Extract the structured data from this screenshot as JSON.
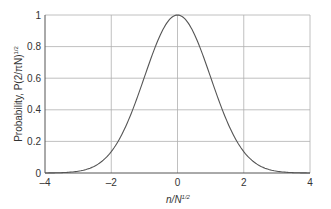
{
  "chart_data": {
    "type": "line",
    "title": "",
    "xlabel": "n/N^1/2",
    "xlabel_parts": {
      "base": "n/N",
      "sup": "1/2"
    },
    "ylabel": "Probability, P(2/πN)^1/2",
    "ylabel_parts": {
      "base": "Probability, P(2/πN)",
      "sup": "1/2"
    },
    "xlim": [
      -4,
      4
    ],
    "ylim": [
      0,
      1
    ],
    "xticks": [
      -4,
      -2,
      0,
      2,
      4
    ],
    "xtick_labels": [
      "–4",
      "–2",
      "0",
      "2",
      "4"
    ],
    "yticks": [
      0,
      0.2,
      0.4,
      0.6,
      0.8,
      1
    ],
    "ytick_labels": [
      "0",
      "0.2",
      "0.4",
      "0.6",
      "0.8",
      "1"
    ],
    "grid": true,
    "legend": null,
    "series": [
      {
        "name": "Gaussian distribution",
        "x": [
          -4,
          -3.5,
          -3,
          -2.5,
          -2,
          -1.75,
          -1.5,
          -1.25,
          -1,
          -0.75,
          -0.5,
          -0.25,
          0,
          0.25,
          0.5,
          0.75,
          1,
          1.25,
          1.5,
          1.75,
          2,
          2.5,
          3,
          3.5,
          4
        ],
        "y": [
          0.0003,
          0.0022,
          0.011,
          0.044,
          0.135,
          0.216,
          0.325,
          0.458,
          0.607,
          0.755,
          0.882,
          0.969,
          1.0,
          0.969,
          0.882,
          0.755,
          0.607,
          0.458,
          0.325,
          0.216,
          0.135,
          0.044,
          0.011,
          0.0022,
          0.0003
        ]
      }
    ]
  },
  "colors": {
    "curve": "#555555",
    "grid": "#b0b0b0",
    "axis": "#555555",
    "text": "#333333"
  }
}
